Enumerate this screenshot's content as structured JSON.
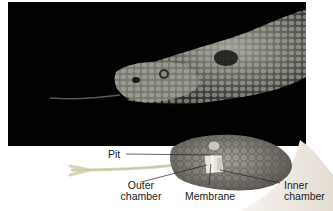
{
  "figure": {
    "photo": {
      "subject": "pit viper head photograph",
      "background_color": "#020202"
    },
    "illustration": {
      "subject": "pit viper head cutaway showing pit organ",
      "labels": [
        {
          "id": "pit",
          "text": "Pit"
        },
        {
          "id": "outer-chamber",
          "text": "Outer chamber",
          "line1": "Outer",
          "line2": "chamber"
        },
        {
          "id": "membrane",
          "text": "Membrane"
        },
        {
          "id": "inner-chamber",
          "text": "Inner chamber",
          "line1": "Inner",
          "line2": "chamber"
        }
      ]
    }
  }
}
